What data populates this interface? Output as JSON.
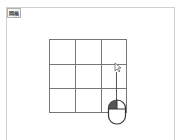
{
  "label": {
    "text": "网格"
  },
  "grid": {
    "rows": 3,
    "cols": 3
  },
  "colors": {
    "grid_line": "#777777",
    "frame": "#d0d0d0",
    "mouse_button": "#555555"
  },
  "icons": {
    "cursor": "pointer-cursor-icon",
    "mouse": "mouse-left-click-icon"
  }
}
